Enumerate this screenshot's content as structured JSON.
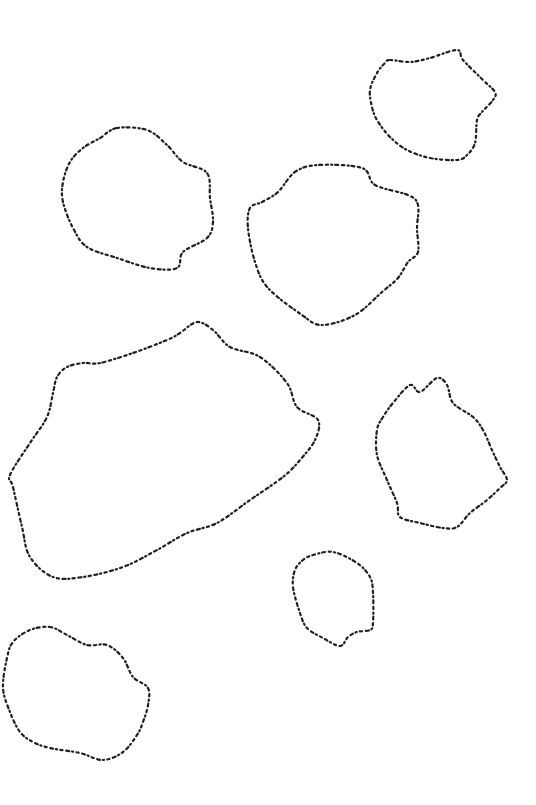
{
  "canvas": {
    "width": 536,
    "height": 805,
    "background": "#ffffff",
    "stroke_color": "#1f1f1f"
  },
  "blobs": [
    {
      "id": "blob-top-right",
      "points": [
        [
          390,
          60
        ],
        [
          410,
          62
        ],
        [
          430,
          58
        ],
        [
          457,
          50
        ],
        [
          463,
          60
        ],
        [
          483,
          80
        ],
        [
          495,
          92
        ],
        [
          493,
          100
        ],
        [
          482,
          112
        ],
        [
          477,
          120
        ],
        [
          475,
          143
        ],
        [
          467,
          155
        ],
        [
          457,
          160
        ],
        [
          430,
          158
        ],
        [
          407,
          150
        ],
        [
          390,
          137
        ],
        [
          377,
          120
        ],
        [
          372,
          107
        ],
        [
          370,
          90
        ],
        [
          377,
          73
        ],
        [
          385,
          63
        ]
      ]
    },
    {
      "id": "blob-upper-left",
      "points": [
        [
          117,
          128
        ],
        [
          147,
          130
        ],
        [
          167,
          145
        ],
        [
          183,
          162
        ],
        [
          207,
          173
        ],
        [
          210,
          198
        ],
        [
          213,
          222
        ],
        [
          207,
          238
        ],
        [
          183,
          252
        ],
        [
          177,
          268
        ],
        [
          150,
          268
        ],
        [
          117,
          258
        ],
        [
          87,
          247
        ],
        [
          73,
          228
        ],
        [
          63,
          202
        ],
        [
          63,
          182
        ],
        [
          70,
          162
        ],
        [
          83,
          148
        ],
        [
          100,
          138
        ]
      ]
    },
    {
      "id": "blob-center",
      "points": [
        [
          295,
          172
        ],
        [
          318,
          165
        ],
        [
          362,
          168
        ],
        [
          375,
          185
        ],
        [
          408,
          195
        ],
        [
          418,
          205
        ],
        [
          417,
          228
        ],
        [
          418,
          252
        ],
        [
          408,
          262
        ],
        [
          398,
          278
        ],
        [
          382,
          292
        ],
        [
          355,
          315
        ],
        [
          322,
          325
        ],
        [
          302,
          315
        ],
        [
          268,
          288
        ],
        [
          255,
          262
        ],
        [
          248,
          228
        ],
        [
          250,
          208
        ],
        [
          262,
          202
        ],
        [
          278,
          192
        ]
      ]
    },
    {
      "id": "blob-large-left",
      "points": [
        [
          197,
          322
        ],
        [
          213,
          330
        ],
        [
          230,
          347
        ],
        [
          260,
          357
        ],
        [
          287,
          383
        ],
        [
          297,
          407
        ],
        [
          318,
          420
        ],
        [
          315,
          440
        ],
        [
          300,
          460
        ],
        [
          283,
          477
        ],
        [
          250,
          500
        ],
        [
          217,
          523
        ],
        [
          187,
          533
        ],
        [
          157,
          550
        ],
        [
          123,
          567
        ],
        [
          83,
          577
        ],
        [
          53,
          577
        ],
        [
          30,
          557
        ],
        [
          22,
          527
        ],
        [
          13,
          487
        ],
        [
          10,
          475
        ],
        [
          30,
          443
        ],
        [
          47,
          417
        ],
        [
          53,
          393
        ],
        [
          57,
          377
        ],
        [
          67,
          367
        ],
        [
          83,
          363
        ],
        [
          100,
          363
        ],
        [
          133,
          353
        ],
        [
          167,
          340
        ],
        [
          180,
          333
        ]
      ]
    },
    {
      "id": "blob-right-middle",
      "points": [
        [
          410,
          385
        ],
        [
          420,
          392
        ],
        [
          437,
          378
        ],
        [
          447,
          385
        ],
        [
          453,
          403
        ],
        [
          473,
          417
        ],
        [
          483,
          430
        ],
        [
          492,
          450
        ],
        [
          500,
          467
        ],
        [
          507,
          480
        ],
        [
          500,
          488
        ],
        [
          487,
          500
        ],
        [
          470,
          513
        ],
        [
          457,
          527
        ],
        [
          443,
          528
        ],
        [
          420,
          523
        ],
        [
          400,
          517
        ],
        [
          397,
          503
        ],
        [
          387,
          480
        ],
        [
          377,
          455
        ],
        [
          377,
          430
        ],
        [
          383,
          417
        ],
        [
          393,
          403
        ]
      ]
    },
    {
      "id": "blob-small-bottom",
      "points": [
        [
          313,
          555
        ],
        [
          333,
          552
        ],
        [
          357,
          563
        ],
        [
          370,
          577
        ],
        [
          373,
          593
        ],
        [
          373,
          623
        ],
        [
          370,
          630
        ],
        [
          357,
          632
        ],
        [
          348,
          637
        ],
        [
          340,
          646
        ],
        [
          323,
          638
        ],
        [
          307,
          628
        ],
        [
          300,
          613
        ],
        [
          293,
          587
        ],
        [
          295,
          570
        ],
        [
          303,
          560
        ]
      ]
    },
    {
      "id": "blob-bottom-left",
      "points": [
        [
          50,
          627
        ],
        [
          67,
          635
        ],
        [
          87,
          645
        ],
        [
          107,
          645
        ],
        [
          123,
          658
        ],
        [
          133,
          677
        ],
        [
          148,
          688
        ],
        [
          148,
          705
        ],
        [
          143,
          722
        ],
        [
          137,
          735
        ],
        [
          123,
          752
        ],
        [
          103,
          760
        ],
        [
          80,
          753
        ],
        [
          50,
          748
        ],
        [
          33,
          742
        ],
        [
          20,
          732
        ],
        [
          10,
          712
        ],
        [
          3,
          688
        ],
        [
          7,
          658
        ],
        [
          13,
          642
        ],
        [
          30,
          630
        ]
      ]
    }
  ]
}
